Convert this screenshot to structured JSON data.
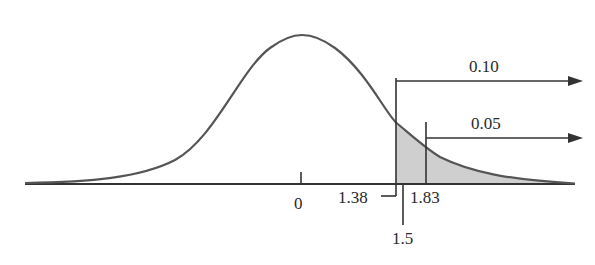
{
  "diagram": {
    "type": "normal-distribution-tail-areas",
    "axis_labels": {
      "zero": "0",
      "critical_010": "1.38",
      "observed": "1.5",
      "critical_005": "1.83"
    },
    "tail_areas": {
      "upper": "0.10",
      "lower": "0.05"
    },
    "colors": {
      "curve": "#555555",
      "shade": "#cfcfcf",
      "lines": "#333333"
    }
  }
}
